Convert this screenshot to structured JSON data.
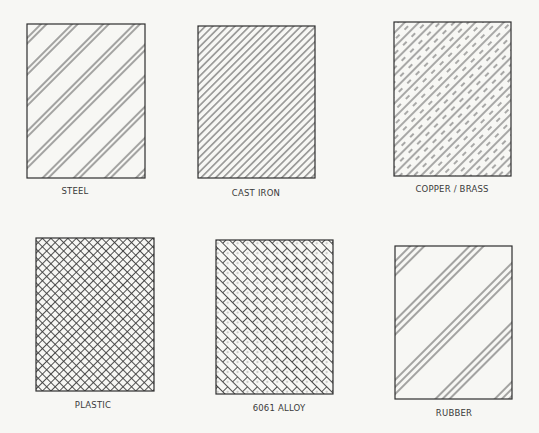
{
  "diagram": {
    "type": "material-hatch-pattern-legend",
    "layout": {
      "rows": 2,
      "columns": 3
    },
    "colors": {
      "background": "#f7f7f4",
      "line": "#3c3c3c",
      "label": "#3a3a3a"
    },
    "swatches": [
      {
        "id": "steel",
        "label": "STEEL",
        "pattern": "paired-diagonal-lines"
      },
      {
        "id": "cast-iron",
        "label": "CAST IRON",
        "pattern": "uniform-diagonal-lines"
      },
      {
        "id": "copper-brass",
        "label": "COPPER / BRASS",
        "pattern": "alternating-solid-dashed-diagonal-lines"
      },
      {
        "id": "plastic",
        "label": "PLASTIC",
        "pattern": "diagonal-crosshatch"
      },
      {
        "id": "alloy-6061",
        "label": "6061 ALLOY",
        "pattern": "diagonal-basket-weave"
      },
      {
        "id": "rubber",
        "label": "RUBBER",
        "pattern": "triple-diagonal-lines"
      }
    ]
  }
}
